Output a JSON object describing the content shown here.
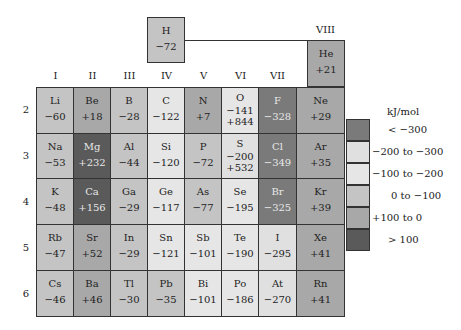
{
  "unit": "kJ/mol",
  "groups": [
    "I",
    "II",
    "III",
    "IV",
    "V",
    "VI",
    "VII",
    "VIII"
  ],
  "periods": [
    "2",
    "3",
    "4",
    "5",
    "6"
  ],
  "colors": {
    "lt_-300": "#7a7a7a",
    "-200_to_-300": "#e0e0e0",
    "-100_to_-200": "#e6e6e6",
    "0_to_-100": "#c4c4c4",
    "+100_to_0": "#a8a8a8",
    "gt_100": "#5a5a5a"
  },
  "hydrogen": {
    "symbol": "H",
    "value": "−72"
  },
  "helium": {
    "symbol": "He",
    "value": "+21"
  },
  "rows": [
    [
      {
        "symbol": "Li",
        "value": "−60"
      },
      {
        "symbol": "Be",
        "value": "+18"
      },
      {
        "symbol": "B",
        "value": "−28"
      },
      {
        "symbol": "C",
        "value": "−122"
      },
      {
        "symbol": "N",
        "value": "+7"
      },
      {
        "symbol": "O",
        "value": "−141",
        "value2": "+844"
      },
      {
        "symbol": "F",
        "value": "−328"
      },
      {
        "symbol": "Ne",
        "value": "+29"
      }
    ],
    [
      {
        "symbol": "Na",
        "value": "−53"
      },
      {
        "symbol": "Mg",
        "value": "+232"
      },
      {
        "symbol": "Al",
        "value": "−44"
      },
      {
        "symbol": "Si",
        "value": "−120"
      },
      {
        "symbol": "P",
        "value": "−72"
      },
      {
        "symbol": "S",
        "value": "−200",
        "value2": "+532"
      },
      {
        "symbol": "Cl",
        "value": "−349"
      },
      {
        "symbol": "Ar",
        "value": "+35"
      }
    ],
    [
      {
        "symbol": "K",
        "value": "−48"
      },
      {
        "symbol": "Ca",
        "value": "+156"
      },
      {
        "symbol": "Ga",
        "value": "−29"
      },
      {
        "symbol": "Ge",
        "value": "−117"
      },
      {
        "symbol": "As",
        "value": "−77"
      },
      {
        "symbol": "Se",
        "value": "−195"
      },
      {
        "symbol": "Br",
        "value": "−325"
      },
      {
        "symbol": "Kr",
        "value": "+39"
      }
    ],
    [
      {
        "symbol": "Rb",
        "value": "−47"
      },
      {
        "symbol": "Sr",
        "value": "+52"
      },
      {
        "symbol": "In",
        "value": "−29"
      },
      {
        "symbol": "Sn",
        "value": "−121"
      },
      {
        "symbol": "Sb",
        "value": "−101"
      },
      {
        "symbol": "Te",
        "value": "−190"
      },
      {
        "symbol": "I",
        "value": "−295"
      },
      {
        "symbol": "Xe",
        "value": "+41"
      }
    ],
    [
      {
        "symbol": "Cs",
        "value": "−46"
      },
      {
        "symbol": "Ba",
        "value": "+46"
      },
      {
        "symbol": "Tl",
        "value": "−30"
      },
      {
        "symbol": "Pb",
        "value": "−35"
      },
      {
        "symbol": "Bi",
        "value": "−101"
      },
      {
        "symbol": "Po",
        "value": "−186"
      },
      {
        "symbol": "At",
        "value": "−270"
      },
      {
        "symbol": "Rn",
        "value": "+41"
      }
    ]
  ],
  "legend": {
    "title": "kJ/mol",
    "items": [
      {
        "label": "<  −300"
      },
      {
        "label": "−200 to −300"
      },
      {
        "label": "−100 to −200"
      },
      {
        "label": "0 to −100"
      },
      {
        "label": "+100 to 0"
      },
      {
        "label": ">  100"
      }
    ]
  }
}
